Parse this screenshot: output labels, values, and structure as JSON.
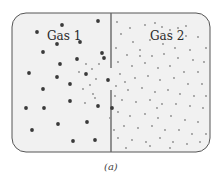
{
  "diagram": {
    "left_label": "Gas 1",
    "right_label": "Gas 2",
    "caption": "(a)",
    "colors": {
      "container_fill": "#f1f1f1",
      "container_stroke": "#555555",
      "divider": "#666666",
      "gas1_particle": "#3a3a3a",
      "gas2_particle": "#8a8a8a"
    },
    "gas1_particles": [
      [
        62,
        25
      ],
      [
        37,
        32
      ],
      [
        98,
        21
      ],
      [
        57,
        44
      ],
      [
        80,
        42
      ],
      [
        43,
        52
      ],
      [
        102,
        53
      ],
      [
        60,
        64
      ],
      [
        29,
        73
      ],
      [
        57,
        77
      ],
      [
        77,
        59
      ],
      [
        86,
        74
      ],
      [
        43,
        89
      ],
      [
        70,
        84
      ],
      [
        26,
        108
      ],
      [
        44,
        108
      ],
      [
        70,
        101
      ],
      [
        98,
        106
      ],
      [
        87,
        122
      ],
      [
        58,
        124
      ],
      [
        32,
        130
      ],
      [
        73,
        141
      ],
      [
        95,
        140
      ],
      [
        108,
        80
      ],
      [
        104,
        58
      ],
      [
        112,
        108
      ]
    ],
    "gas1_small": [
      [
        86,
        64
      ],
      [
        92,
        69
      ],
      [
        99,
        64
      ],
      [
        96,
        79
      ],
      [
        90,
        85
      ],
      [
        79,
        72
      ],
      [
        83,
        89
      ],
      [
        93,
        94
      ],
      [
        85,
        103
      ],
      [
        95,
        98
      ]
    ],
    "gas2_particles": [
      [
        117,
        22
      ],
      [
        130,
        28
      ],
      [
        145,
        25
      ],
      [
        155,
        23
      ],
      [
        162,
        27
      ],
      [
        170,
        30
      ],
      [
        178,
        28
      ],
      [
        186,
        36
      ],
      [
        198,
        37
      ],
      [
        121,
        34
      ],
      [
        133,
        42
      ],
      [
        150,
        40
      ],
      [
        163,
        44
      ],
      [
        175,
        48
      ],
      [
        190,
        50
      ],
      [
        116,
        48
      ],
      [
        127,
        55
      ],
      [
        140,
        50
      ],
      [
        152,
        56
      ],
      [
        164,
        54
      ],
      [
        178,
        58
      ],
      [
        193,
        60
      ],
      [
        204,
        62
      ],
      [
        118,
        62
      ],
      [
        132,
        66
      ],
      [
        145,
        63
      ],
      [
        158,
        68
      ],
      [
        170,
        66
      ],
      [
        184,
        72
      ],
      [
        198,
        72
      ],
      [
        120,
        74
      ],
      [
        135,
        78
      ],
      [
        148,
        76
      ],
      [
        160,
        80
      ],
      [
        174,
        78
      ],
      [
        188,
        84
      ],
      [
        202,
        84
      ],
      [
        116,
        86
      ],
      [
        128,
        90
      ],
      [
        142,
        88
      ],
      [
        155,
        92
      ],
      [
        168,
        90
      ],
      [
        180,
        94
      ],
      [
        194,
        96
      ],
      [
        206,
        96
      ],
      [
        122,
        100
      ],
      [
        136,
        102
      ],
      [
        150,
        100
      ],
      [
        162,
        104
      ],
      [
        176,
        104
      ],
      [
        190,
        106
      ],
      [
        203,
        108
      ],
      [
        118,
        112
      ],
      [
        130,
        116
      ],
      [
        145,
        114
      ],
      [
        158,
        118
      ],
      [
        171,
        116
      ],
      [
        185,
        120
      ],
      [
        198,
        122
      ],
      [
        124,
        126
      ],
      [
        138,
        128
      ],
      [
        152,
        126
      ],
      [
        165,
        130
      ],
      [
        179,
        130
      ],
      [
        192,
        134
      ],
      [
        206,
        134
      ],
      [
        118,
        138
      ],
      [
        132,
        140
      ],
      [
        146,
        142
      ],
      [
        160,
        138
      ],
      [
        173,
        142
      ],
      [
        187,
        144
      ],
      [
        200,
        142
      ],
      [
        126,
        148
      ],
      [
        150,
        146
      ],
      [
        170,
        148
      ],
      [
        114,
        130
      ],
      [
        140,
        56
      ],
      [
        186,
        26
      ],
      [
        206,
        48
      ],
      [
        125,
        82
      ],
      [
        157,
        108
      ],
      [
        110,
        118
      ],
      [
        115,
        96
      ]
    ]
  }
}
